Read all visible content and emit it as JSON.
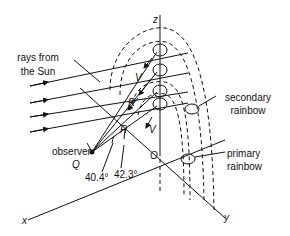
{
  "diagram": {
    "axes": {
      "x": "x",
      "y": "y",
      "z": "z"
    },
    "origin_label": "O",
    "observer_label": "observer",
    "observer_point": "Q",
    "sun_rays_label_line1": "rays from",
    "sun_rays_label_line2": "the Sun",
    "secondary_label_line1": "secondary",
    "secondary_label_line2": "rainbow",
    "primary_label_line1": "primary",
    "primary_label_line2": "rainbow",
    "ray_labels": {
      "violet_top": "V",
      "red_top": "R",
      "red_bottom": "R",
      "violet_bottom": "V"
    },
    "angles": {
      "primary_red": "40.4°",
      "primary_violet": "42.3°"
    },
    "colors": {
      "line": "#111111",
      "background": "#ffffff"
    }
  }
}
